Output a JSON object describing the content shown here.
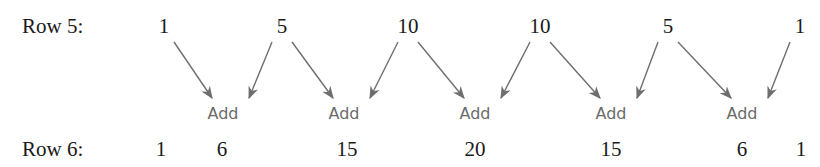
{
  "colors": {
    "text": "#1a1a1a",
    "add_label": "#6a6a6a",
    "arrow": "#6e6e6e"
  },
  "row5": {
    "label": "Row 5:",
    "values": [
      "1",
      "5",
      "10",
      "10",
      "5",
      "1"
    ]
  },
  "row6": {
    "label": "Row 6:",
    "values": [
      "1",
      "6",
      "15",
      "20",
      "15",
      "6",
      "1"
    ]
  },
  "operations": [
    {
      "label": "Add",
      "from": [
        0,
        1
      ],
      "result_index": 1
    },
    {
      "label": "Add",
      "from": [
        1,
        2
      ],
      "result_index": 2
    },
    {
      "label": "Add",
      "from": [
        2,
        3
      ],
      "result_index": 3
    },
    {
      "label": "Add",
      "from": [
        3,
        4
      ],
      "result_index": 4
    },
    {
      "label": "Add",
      "from": [
        4,
        5
      ],
      "result_index": 5
    }
  ]
}
